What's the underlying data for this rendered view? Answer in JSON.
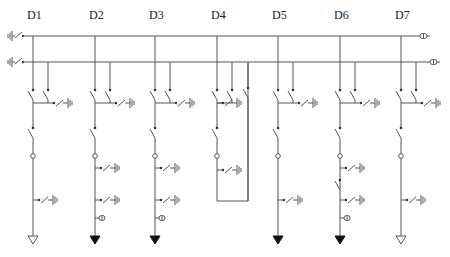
{
  "diagram": {
    "bays": [
      {
        "id": "D1",
        "label": "D1",
        "x": 33,
        "terminal": "open-triangle",
        "extra_earth": false,
        "ct": false,
        "loop": false
      },
      {
        "id": "D2",
        "label": "D2",
        "x": 95,
        "terminal": "filled-triangle",
        "extra_earth": true,
        "ct": true,
        "loop": false
      },
      {
        "id": "D3",
        "label": "D3",
        "x": 155,
        "terminal": "filled-triangle",
        "extra_earth": true,
        "ct": true,
        "loop": false
      },
      {
        "id": "D4",
        "label": "D4",
        "x": 217,
        "terminal": "none",
        "extra_earth": false,
        "ct": false,
        "loop": true
      },
      {
        "id": "D5",
        "label": "D5",
        "x": 278,
        "terminal": "filled-triangle",
        "extra_earth": false,
        "ct": false,
        "loop": false
      },
      {
        "id": "D6",
        "label": "D6",
        "x": 340,
        "terminal": "filled-triangle",
        "extra_earth": true,
        "ct": true,
        "loop": false,
        "second_switch": true
      },
      {
        "id": "D7",
        "label": "D7",
        "x": 401,
        "terminal": "open-triangle",
        "extra_earth": false,
        "ct": false,
        "loop": false
      }
    ],
    "busbars": [
      {
        "id": "bus-1",
        "y": 36,
        "x_start": 22,
        "x_end": 430,
        "end_symbol": "voltage-transformer"
      },
      {
        "id": "bus-2",
        "y": 62,
        "x_start": 22,
        "x_end": 440,
        "end_symbol": "voltage-transformer"
      }
    ],
    "colors": {
      "line": "#555555",
      "text": "#222222",
      "background": "#ffffff"
    }
  }
}
